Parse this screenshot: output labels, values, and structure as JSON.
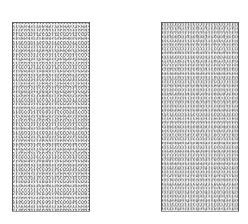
{
  "figure": {
    "canvas": {
      "width": 248,
      "height": 224,
      "background_color": "#ffffff"
    },
    "blocks": [
      {
        "name": "left-block",
        "label": "",
        "x": 12,
        "y": 22,
        "width": 78,
        "height": 190,
        "fill": "stipple",
        "fill_color": "#f2f2f2",
        "stipple_color": "#8c8c8c",
        "border_color": "#5a5a5a"
      },
      {
        "name": "right-block",
        "label": "",
        "x": 161,
        "y": 22,
        "width": 78,
        "height": 190,
        "fill": "stipple",
        "fill_color": "#f2f2f2",
        "stipple_color": "#8c8c8c",
        "border_color": "#5a5a5a"
      }
    ],
    "opening": {
      "name": "center-opening",
      "label": "",
      "x": 90,
      "y": 22,
      "width": 71,
      "height": 190,
      "fill_color": "#ffffff"
    },
    "edges": [
      {
        "name": "left-block-top-edge",
        "orientation": "horizontal",
        "x": 12,
        "y": 22,
        "length": 78,
        "color": "#6b6b6b"
      },
      {
        "name": "left-block-left-edge",
        "orientation": "vertical",
        "x": 12,
        "y": 22,
        "length": 190,
        "color": "#5a5a5a"
      },
      {
        "name": "left-block-right-edge",
        "orientation": "vertical",
        "x": 89,
        "y": 22,
        "length": 190,
        "color": "#5a5a5a"
      },
      {
        "name": "left-block-bottom-edge",
        "orientation": "horizontal",
        "x": 12,
        "y": 211,
        "length": 78,
        "color": "#9b9b9b"
      },
      {
        "name": "right-block-top-edge",
        "orientation": "horizontal",
        "x": 161,
        "y": 22,
        "length": 78,
        "color": "#6b6b6b"
      },
      {
        "name": "right-block-left-edge",
        "orientation": "vertical",
        "x": 161,
        "y": 22,
        "length": 190,
        "color": "#5a5a5a"
      },
      {
        "name": "right-block-right-edge",
        "orientation": "vertical",
        "x": 238,
        "y": 22,
        "length": 190,
        "color": "#5a5a5a"
      },
      {
        "name": "right-block-bottom-edge",
        "orientation": "horizontal",
        "x": 161,
        "y": 211,
        "length": 78,
        "color": "#9b9b9b"
      }
    ]
  }
}
